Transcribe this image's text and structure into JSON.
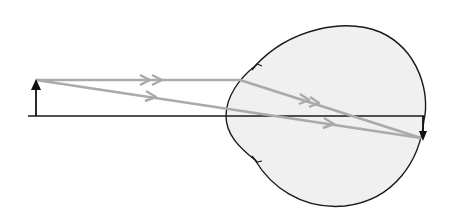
{
  "diagram": {
    "colors": {
      "background": "#ffffff",
      "eyeball_fill": "#f0f0f0",
      "outline": "#1a1a1a",
      "ray": "#aaaaaa",
      "axis": "#1a1a1a",
      "arrow": "#111111"
    },
    "elements": [
      "optical-axis",
      "object-arrow",
      "eyeball",
      "ray-parallel",
      "ray-chief",
      "image-arrow"
    ]
  }
}
